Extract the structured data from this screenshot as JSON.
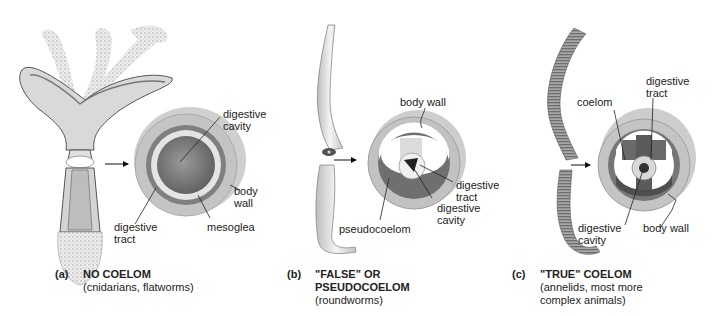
{
  "figure": {
    "panels": [
      {
        "id": "a",
        "letter": "(a)",
        "title": "NO COELOM",
        "subtitle": "(cnidarians, flatworms)",
        "organism_illustration": "hydra",
        "labels": {
          "digestive_cavity": "digestive\ncavity",
          "body_wall": "body\nwall",
          "digestive_tract": "digestive\ntract",
          "mesoglea": "mesoglea"
        }
      },
      {
        "id": "b",
        "letter": "(b)",
        "title": "\"FALSE\" OR\nPSEUDOCOELOM",
        "subtitle": "(roundworms)",
        "organism_illustration": "roundworm",
        "labels": {
          "body_wall": "body wall",
          "digestive_tract": "digestive\ntract",
          "digestive_cavity": "digestive\ncavity",
          "pseudocoelom": "pseudocoelom"
        }
      },
      {
        "id": "c",
        "letter": "(c)",
        "title": "\"TRUE\" COELOM",
        "subtitle": "(annelids, most more\ncomplex animals)",
        "organism_illustration": "earthworm",
        "labels": {
          "digestive_tract": "digestive\ntract",
          "coelom": "coelom",
          "digestive_cavity": "digestive\ncavity",
          "body_wall": "body wall"
        }
      }
    ],
    "colors": {
      "outer_wall": "#c9c9c9",
      "mid_layer": "#7d7d7d",
      "dark_cavity": "#4a4a4a",
      "light_fill": "#e6e6e6",
      "text": "#222222"
    }
  }
}
